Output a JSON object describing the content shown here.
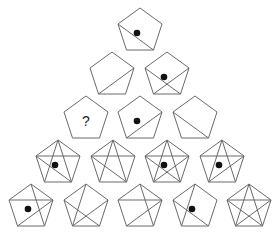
{
  "puzzle": {
    "title": "Pentagon pyramid pattern",
    "question_mark": "?",
    "colors": {
      "stroke": "#6a6a6a",
      "dot": "#111111",
      "background": "#ffffff"
    },
    "rows": [
      {
        "row": 1,
        "cells": [
          {
            "cx": 140,
            "top": 8,
            "lines": [
              "L-BR"
            ],
            "dot": true,
            "label": ""
          }
        ]
      },
      {
        "row": 2,
        "cells": [
          {
            "cx": 112,
            "top": 52,
            "lines": [
              "R-BL"
            ],
            "dot": false,
            "label": ""
          },
          {
            "cx": 167,
            "top": 52,
            "lines": [
              "L-BR",
              "R-BL"
            ],
            "dot": true,
            "label": ""
          }
        ]
      },
      {
        "row": 3,
        "cells": [
          {
            "cx": 86,
            "top": 96,
            "lines": [],
            "dot": false,
            "label": "?"
          },
          {
            "cx": 140,
            "top": 96,
            "lines": [
              "R-BL"
            ],
            "dot": true,
            "label": ""
          },
          {
            "cx": 195,
            "top": 96,
            "lines": [
              "L-BR"
            ],
            "dot": false,
            "label": ""
          }
        ]
      },
      {
        "row": 4,
        "cells": [
          {
            "cx": 58,
            "top": 140,
            "lines": [
              "L-R",
              "T-BL",
              "T-BR",
              "L-BR"
            ],
            "dot": true,
            "label": ""
          },
          {
            "cx": 113,
            "top": 140,
            "lines": [
              "L-R",
              "T-BL",
              "T-BR",
              "L-BR"
            ],
            "dot": false,
            "label": ""
          },
          {
            "cx": 167,
            "top": 140,
            "lines": [
              "L-R",
              "T-BL",
              "T-BR",
              "L-BR",
              "R-BL"
            ],
            "dot": true,
            "label": ""
          },
          {
            "cx": 222,
            "top": 140,
            "lines": [
              "L-R",
              "T-BL",
              "T-BR",
              "R-BL"
            ],
            "dot": true,
            "label": ""
          }
        ]
      },
      {
        "row": 5,
        "cells": [
          {
            "cx": 31,
            "top": 184,
            "lines": [
              "L-R",
              "T-BR",
              "R-BL"
            ],
            "dot": true,
            "label": ""
          },
          {
            "cx": 86,
            "top": 184,
            "lines": [
              "T-BL",
              "L-BR",
              "R-BL"
            ],
            "dot": false,
            "label": ""
          },
          {
            "cx": 140,
            "top": 184,
            "lines": [
              "L-R",
              "T-BR",
              "R-BL"
            ],
            "dot": false,
            "label": ""
          },
          {
            "cx": 195,
            "top": 184,
            "lines": [
              "T-BL",
              "L-BR"
            ],
            "dot": true,
            "label": ""
          },
          {
            "cx": 249,
            "top": 184,
            "lines": [
              "L-R",
              "T-BL",
              "T-BR",
              "L-BR",
              "R-BL"
            ],
            "dot": false,
            "label": ""
          }
        ]
      }
    ]
  }
}
